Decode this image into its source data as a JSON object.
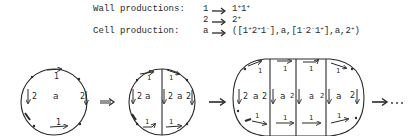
{
  "rules": {
    "wall_label": "Wall productions:",
    "cell_label": "Cell production:",
    "wall": [
      {
        "lhs": "1",
        "rhs_parts": [
          {
            "t": "1"
          },
          {
            "s": "+"
          },
          {
            "t": "1"
          },
          {
            "s": "+"
          }
        ]
      },
      {
        "lhs": "2",
        "rhs_parts": [
          {
            "t": "2"
          },
          {
            "s": "+"
          }
        ]
      }
    ],
    "cell": {
      "lhs": "a",
      "rhs_parts": [
        {
          "t": "([1"
        },
        {
          "s": "+"
        },
        {
          "t": "2"
        },
        {
          "s": "+"
        },
        {
          "t": "1"
        },
        {
          "s": "-"
        },
        {
          "t": "],a,[1"
        },
        {
          "s": "-"
        },
        {
          "t": "2"
        },
        {
          "s": "-"
        },
        {
          "t": "1"
        },
        {
          "s": "+"
        },
        {
          "t": "],a,2"
        },
        {
          "s": "+"
        },
        {
          "t": ")"
        }
      ]
    }
  },
  "diagram": {
    "cell_label": "a",
    "wall_label_1": "1",
    "wall_label_2": "2",
    "stage1_arrow": "⟹",
    "stage2_arrow": "→",
    "stage3_arrow": "→",
    "ellipsis": "···",
    "stages": [
      {
        "name": "stage-1",
        "cells": 1
      },
      {
        "name": "stage-2",
        "cells": 2
      },
      {
        "name": "stage-3",
        "cells": 4
      }
    ]
  }
}
